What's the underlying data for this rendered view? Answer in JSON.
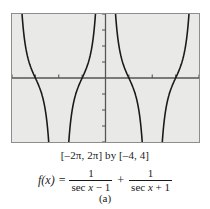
{
  "figure": {
    "panel_label": "(a)",
    "range_caption": "[–2π, 2π] by [–4, 4]",
    "formula": {
      "lhs": "f(x)",
      "equals": "=",
      "term1": {
        "numerator": "1",
        "denominator_fn": "sec",
        "denominator_var": "x",
        "denominator_op": "− 1"
      },
      "operator": "+",
      "term2": {
        "numerator": "1",
        "denominator_fn": "sec",
        "denominator_var": "x",
        "denominator_op": "+ 1"
      },
      "plain_text": "f(x) = 1/(sec x − 1) + 1/(sec x + 1)"
    },
    "colors": {
      "screen_background": "#e9e9e7",
      "screen_border": "#8d8d8d",
      "axis": "#555555",
      "curve": "#1a1a1a",
      "page_background": "#ffffff",
      "text": "#1a1a1a"
    }
  },
  "chart_data": {
    "type": "line",
    "title": "",
    "subtitle": "",
    "xlabel": "",
    "ylabel": "",
    "xlim": [
      -6.283185,
      6.283185
    ],
    "ylim": [
      -4,
      4
    ],
    "xlim_label": "[–2π, 2π]",
    "ylim_label": "[–4, 4]",
    "grid": false,
    "legend": null,
    "axes": {
      "x_axis_at_y": 0,
      "y_axis_at_x": 0,
      "x_tick_spacing": 3.141593,
      "y_tick_spacing": 1,
      "x_ticks": [
        -6.283185,
        -3.141593,
        0,
        3.141593,
        6.283185
      ],
      "y_ticks": [
        -4,
        -3,
        -2,
        -1,
        0,
        1,
        2,
        3,
        4
      ],
      "tick_labels_shown": false
    },
    "function": "f(x) = 1/(sec x - 1) + 1/(sec x + 1)",
    "simplified": "f(x) = 2*sec(x)/(sec(x)^2 - 1) = 2*cos(x)/sin(x)^2",
    "vertical_asymptotes": [
      -6.283185,
      -3.141593,
      0,
      3.141593,
      6.283185
    ],
    "zeros": [
      -4.712389,
      -1.570796,
      1.570796,
      4.712389
    ],
    "series": [
      {
        "name": "f(x)",
        "color": "#1a1a1a",
        "linewidth": 1.6,
        "branches": [
          {
            "x_domain": [
              -6.283185,
              -3.141593
            ],
            "shape": "u-branch-min-at-x=-4.712389",
            "note": "rises to +inf at both asymptote ends, crosses y=0 at x=-3pi/2"
          },
          {
            "x_domain": [
              -3.141593,
              0
            ],
            "shape": "n-branch",
            "note": "descends to -inf at both asymptote ends"
          },
          {
            "x_domain": [
              0,
              3.141593
            ],
            "shape": "u-branch-min-at-x=1.570796",
            "note": "rises to +inf at both asymptote ends, crosses y=0 at x=pi/2"
          },
          {
            "x_domain": [
              3.141593,
              6.283185
            ],
            "shape": "n-branch",
            "note": "descends to -inf at both asymptote ends"
          }
        ],
        "sample_points": [
          {
            "x": -6.1,
            "y": 3.9
          },
          {
            "x": -5.8,
            "y": 1.7
          },
          {
            "x": -5.5,
            "y": 0.9
          },
          {
            "x": -5.0,
            "y": 0.2
          },
          {
            "x": -4.712389,
            "y": 0.0
          },
          {
            "x": -4.4,
            "y": -0.3
          },
          {
            "x": -4.0,
            "y": -0.8
          },
          {
            "x": -3.6,
            "y": -1.8
          },
          {
            "x": -3.35,
            "y": -3.6
          },
          {
            "x": -2.95,
            "y": -3.8
          },
          {
            "x": -2.7,
            "y": -1.9
          },
          {
            "x": -2.3,
            "y": -0.9
          },
          {
            "x": -1.9,
            "y": -0.4
          },
          {
            "x": -1.570796,
            "y": 0.0
          },
          {
            "x": -1.2,
            "y": 0.4
          },
          {
            "x": -0.8,
            "y": 1.4
          },
          {
            "x": -0.5,
            "y": 3.2
          },
          {
            "x": -0.35,
            "y": 3.9
          },
          {
            "x": 0.35,
            "y": 3.9
          },
          {
            "x": 0.5,
            "y": 3.2
          },
          {
            "x": 0.8,
            "y": 1.4
          },
          {
            "x": 1.2,
            "y": 0.4
          },
          {
            "x": 1.570796,
            "y": 0.0
          },
          {
            "x": 1.9,
            "y": -0.4
          },
          {
            "x": 2.3,
            "y": -0.9
          },
          {
            "x": 2.7,
            "y": -1.9
          },
          {
            "x": 2.95,
            "y": -3.8
          },
          {
            "x": 3.35,
            "y": -3.6
          },
          {
            "x": 3.6,
            "y": -1.8
          },
          {
            "x": 4.0,
            "y": -0.8
          },
          {
            "x": 4.4,
            "y": -0.3
          },
          {
            "x": 4.712389,
            "y": 0.0
          },
          {
            "x": 5.0,
            "y": 0.2
          },
          {
            "x": 5.5,
            "y": 0.9
          },
          {
            "x": 5.8,
            "y": 1.7
          },
          {
            "x": 6.1,
            "y": 3.9
          }
        ]
      }
    ]
  }
}
